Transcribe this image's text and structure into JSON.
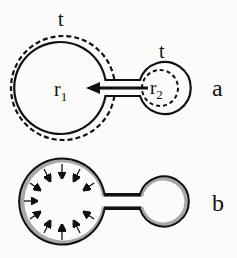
{
  "panel_a": {
    "label": "a",
    "big_bubble": {
      "radius_label": "r",
      "radius_sub": "1",
      "thickness_label": "t"
    },
    "small_bubble": {
      "radius_label": "r",
      "radius_sub": "2",
      "thickness_label": "t"
    }
  },
  "panel_b": {
    "label": "b"
  },
  "colors": {
    "stroke": "#111111",
    "film": "#a8a8a8",
    "background": "#fbfbf9"
  }
}
